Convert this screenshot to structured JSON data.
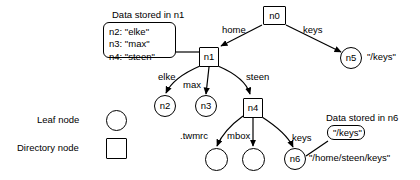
{
  "diagram": {
    "title_n1_callout": "Data stored in n1",
    "title_n6_callout": "Data stored in n6",
    "n1_data_lines": "n2: \"elke\"\nn3: \"max\"\nn4: \"steen\"",
    "n6_data_value": "\"/keys\"",
    "nodes": {
      "n0": "n0",
      "n1": "n1",
      "n2": "n2",
      "n3": "n3",
      "n4": "n4",
      "n5": "n5",
      "n6": "n6",
      "leaf_twmrc": "",
      "leaf_mbox": ""
    },
    "annotations": {
      "n5_path": "\"/keys\"",
      "n6_path": "\"/home/steen/keys\""
    },
    "edges": [
      {
        "from": "n0",
        "to": "n1",
        "label": "home"
      },
      {
        "from": "n0",
        "to": "n5",
        "label": "keys"
      },
      {
        "from": "n1",
        "to": "n2",
        "label": "elke"
      },
      {
        "from": "n1",
        "to": "n3",
        "label": "max"
      },
      {
        "from": "n1",
        "to": "n4",
        "label": "steen"
      },
      {
        "from": "n4",
        "to": "leaf_twmrc",
        "label": ".twmrc"
      },
      {
        "from": "n4",
        "to": "leaf_mbox",
        "label": "mbox"
      },
      {
        "from": "n4",
        "to": "n6",
        "label": "keys"
      }
    ],
    "edge_labels": {
      "home": "home",
      "keys_top": "keys",
      "elke": "elke",
      "max": "max",
      "steen": "steen",
      "twmrc": ".twmrc",
      "mbox": "mbox",
      "keys_bottom": "keys"
    },
    "legend": {
      "leaf_label": "Leaf node",
      "dir_label": "Directory node"
    },
    "colors": {
      "stroke": "#000000",
      "fill": "#ffffff",
      "text": "#000000"
    }
  }
}
